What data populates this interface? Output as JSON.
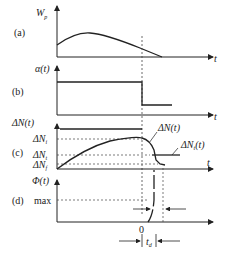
{
  "figure": {
    "panels": {
      "a": {
        "label": "(a)",
        "ylabel": "W",
        "ylabel_sub": "p",
        "xlabel": "t"
      },
      "b": {
        "label": "(b)",
        "ylabel": "α(t)",
        "xlabel": "t"
      },
      "c": {
        "label": "(c)",
        "ylabel": "ΔN(t)",
        "xlabel": "t",
        "levels": [
          {
            "text": "ΔN",
            "sub": "i"
          },
          {
            "text": "ΔN",
            "sub": "t"
          },
          {
            "text": "ΔN",
            "sub": "f"
          }
        ],
        "curve_labels": [
          {
            "text": "ΔN(t)"
          },
          {
            "text": "ΔN",
            "sub": "t",
            "suffix": "(t)"
          }
        ]
      },
      "d": {
        "label": "(d)",
        "ylabel": "Φ(t)",
        "max_label": "max",
        "zero_label": "0",
        "td_label": "t",
        "td_sub": "d"
      }
    },
    "colors": {
      "line": "#222222",
      "dashed": "#444444",
      "background": "#ffffff"
    }
  }
}
